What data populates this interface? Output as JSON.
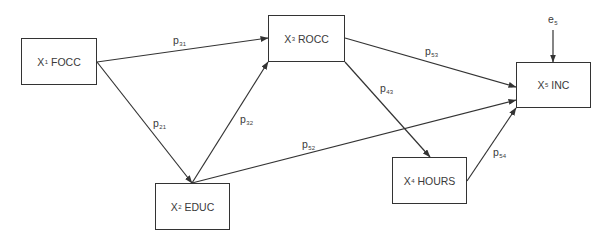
{
  "diagram": {
    "type": "path-diagram",
    "nodes": [
      {
        "id": "x1",
        "var": "X",
        "sub": "1",
        "name": "FOCC"
      },
      {
        "id": "x2",
        "var": "X",
        "sub": "2",
        "name": "EDUC"
      },
      {
        "id": "x3",
        "var": "X",
        "sub": "3",
        "name": "ROCC"
      },
      {
        "id": "x4",
        "var": "X",
        "sub": "4",
        "name": "HOURS"
      },
      {
        "id": "x5",
        "var": "X",
        "sub": "5",
        "name": "INC"
      }
    ],
    "error_term": {
      "base": "e",
      "sub": "5",
      "target": "x5"
    },
    "paths": [
      {
        "from": "x1",
        "to": "x3",
        "base": "p",
        "sub": "31"
      },
      {
        "from": "x1",
        "to": "x2",
        "base": "p",
        "sub": "21"
      },
      {
        "from": "x2",
        "to": "x3",
        "base": "p",
        "sub": "32"
      },
      {
        "from": "x2",
        "to": "x5",
        "base": "p",
        "sub": "52"
      },
      {
        "from": "x3",
        "to": "x5",
        "base": "p",
        "sub": "53"
      },
      {
        "from": "x3",
        "to": "x4",
        "base": "p",
        "sub": "43"
      },
      {
        "from": "x4",
        "to": "x5",
        "base": "p",
        "sub": "54"
      }
    ],
    "colors": {
      "line": "#333333",
      "text": "#3a3a3a",
      "background": "#ffffff"
    }
  }
}
